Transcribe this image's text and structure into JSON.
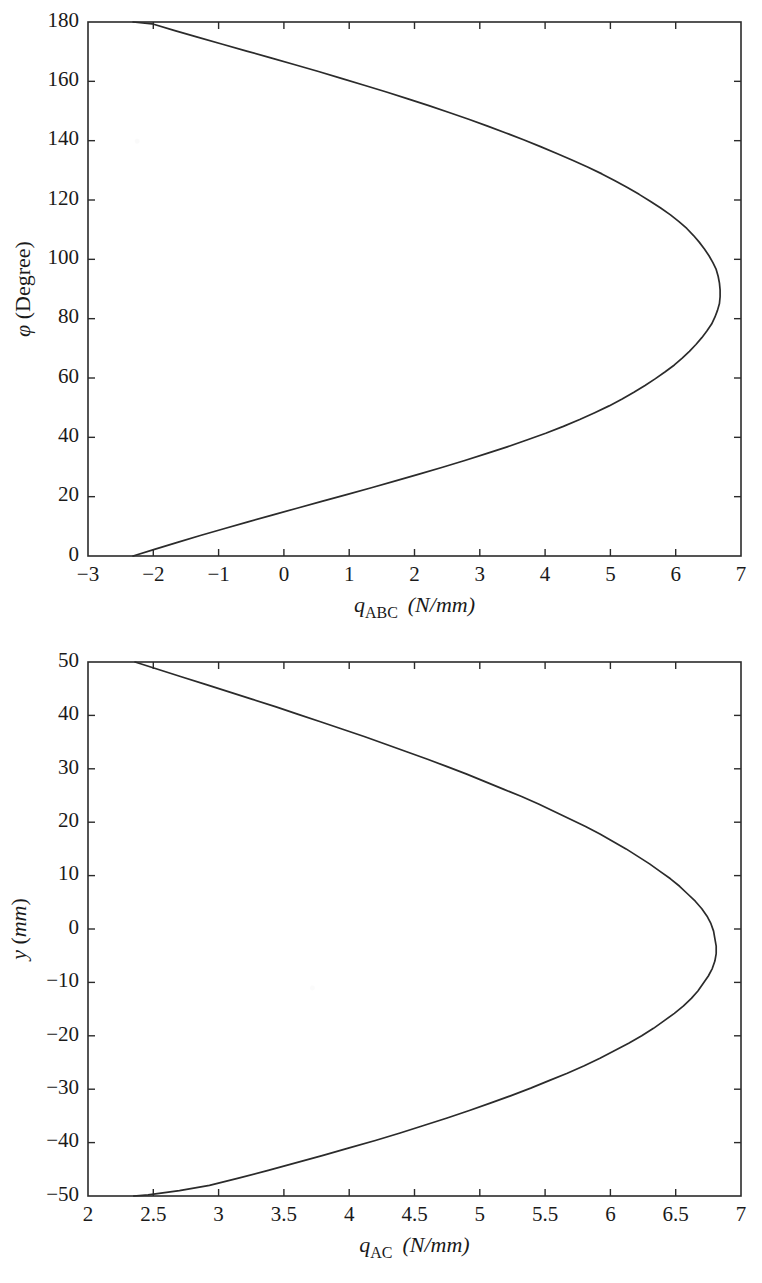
{
  "page": {
    "width": 762,
    "height": 1283,
    "background": "#ffffff",
    "ink_color": "#2b2b2b"
  },
  "chart_data": [
    {
      "id": "chart-qabc",
      "type": "line",
      "title": "",
      "subtitle": "",
      "xlabel_plain": "q_ABC (N/mm)",
      "xlabel_parts": {
        "symbol": "q",
        "subscript": "ABC",
        "unit": "(N/mm)"
      },
      "ylabel_plain": "φ (Degree)",
      "ylabel_parts": {
        "symbol": "φ",
        "unit": "(Degree)"
      },
      "xlim": [
        -3,
        7
      ],
      "ylim": [
        0,
        180
      ],
      "xticks": [
        -3,
        -2,
        -1,
        0,
        1,
        2,
        3,
        4,
        5,
        6,
        7
      ],
      "xticklabels": [
        "−3",
        "−2",
        "−1",
        "0",
        "1",
        "2",
        "3",
        "4",
        "5",
        "6",
        "7"
      ],
      "yticks": [
        0,
        20,
        40,
        60,
        80,
        100,
        120,
        140,
        160,
        180
      ],
      "yticklabels": [
        "0",
        "20",
        "40",
        "60",
        "80",
        "100",
        "120",
        "140",
        "160",
        "180"
      ],
      "grid": false,
      "legend": null,
      "series": [
        {
          "name": "q_ABC",
          "color": "#2b2b2b",
          "x": [
            -2.31,
            -1.97,
            -1.63,
            -1.28,
            -0.92,
            -0.55,
            -0.18,
            0.2,
            0.58,
            0.96,
            1.34,
            1.71,
            2.07,
            2.43,
            2.77,
            3.1,
            3.42,
            3.72,
            4.01,
            4.28,
            4.53,
            4.76,
            4.98,
            5.18,
            5.36,
            5.53,
            5.69,
            5.84,
            5.98,
            6.1,
            6.21,
            6.31,
            6.4,
            6.48,
            6.55,
            6.6,
            6.64,
            6.67,
            6.68,
            6.68,
            6.67,
            6.65,
            6.62,
            6.57,
            6.51,
            6.44,
            6.36,
            6.27,
            6.17,
            6.05,
            5.92,
            5.77,
            5.61,
            5.44,
            5.26,
            5.07,
            4.87,
            4.65,
            4.42,
            4.18,
            3.93,
            3.67,
            3.4,
            3.12,
            2.83,
            2.53,
            2.22,
            1.9,
            1.57,
            1.23,
            0.88,
            0.53,
            0.17,
            -0.2,
            -0.57,
            -0.94,
            -1.31,
            -1.67,
            -2.02,
            -2.31
          ],
          "y": [
            0,
            2.3,
            4.6,
            6.9,
            9.2,
            11.5,
            13.8,
            16.1,
            18.4,
            20.7,
            23.0,
            25.3,
            27.6,
            29.9,
            32.2,
            34.5,
            36.8,
            39.1,
            41.4,
            43.7,
            46.0,
            48.3,
            50.6,
            52.9,
            55.2,
            57.5,
            59.8,
            62.1,
            64.4,
            66.7,
            69.0,
            71.3,
            73.6,
            75.9,
            78.2,
            80.5,
            82.8,
            85.1,
            87.4,
            89.7,
            92.0,
            94.3,
            96.6,
            98.9,
            101.2,
            103.5,
            105.8,
            108.1,
            110.4,
            112.7,
            115.0,
            117.3,
            119.6,
            121.9,
            124.2,
            126.5,
            128.8,
            131.1,
            133.4,
            135.7,
            138.0,
            140.3,
            142.6,
            144.9,
            147.2,
            149.5,
            151.8,
            154.1,
            156.4,
            158.7,
            161.0,
            163.3,
            165.6,
            167.9,
            170.2,
            172.5,
            174.8,
            177.1,
            179.4,
            180
          ]
        }
      ],
      "annotations": {
        "curve_min_x": -2.31,
        "curve_max_x": 6.68,
        "curve_max_at_y": 88
      }
    },
    {
      "id": "chart-qac",
      "type": "line",
      "title": "",
      "subtitle": "",
      "xlabel_plain": "q_AC (N/mm)",
      "xlabel_parts": {
        "symbol": "q",
        "subscript": "AC",
        "unit": "(N/mm)"
      },
      "ylabel_plain": "y (mm)",
      "ylabel_parts": {
        "symbol": "y",
        "unit": "(mm)"
      },
      "xlim": [
        2,
        7
      ],
      "ylim": [
        -50,
        50
      ],
      "xticks": [
        2,
        2.5,
        3,
        3.5,
        4,
        4.5,
        5,
        5.5,
        6,
        6.5,
        7
      ],
      "xticklabels": [
        "2",
        "2.5",
        "3",
        "3.5",
        "4",
        "4.5",
        "5",
        "5.5",
        "6",
        "6.5",
        "7"
      ],
      "yticks": [
        -50,
        -40,
        -30,
        -20,
        -10,
        0,
        10,
        20,
        30,
        40,
        50
      ],
      "yticklabels": [
        "−50",
        "−40",
        "−30",
        "−20",
        "−10",
        "0",
        "10",
        "20",
        "30",
        "40",
        "50"
      ],
      "grid": false,
      "legend": null,
      "series": [
        {
          "name": "q_AC",
          "color": "#2b2b2b",
          "x": [
            2.36,
            2.54,
            2.72,
            2.9,
            3.08,
            3.26,
            3.44,
            3.61,
            3.78,
            3.95,
            4.12,
            4.28,
            4.44,
            4.6,
            4.75,
            4.9,
            5.04,
            5.18,
            5.32,
            5.45,
            5.57,
            5.69,
            5.81,
            5.92,
            6.02,
            6.12,
            6.21,
            6.3,
            6.38,
            6.46,
            6.53,
            6.59,
            6.65,
            6.7,
            6.74,
            6.77,
            6.79,
            6.8,
            6.81,
            6.81,
            6.8,
            6.78,
            6.75,
            6.71,
            6.67,
            6.62,
            6.56,
            6.49,
            6.41,
            6.33,
            6.24,
            6.14,
            6.03,
            5.92,
            5.8,
            5.67,
            5.53,
            5.39,
            5.24,
            5.08,
            4.92,
            4.75,
            4.57,
            4.39,
            4.2,
            4.0,
            3.8,
            3.59,
            3.38,
            3.16,
            2.93,
            2.7,
            2.46,
            2.35
          ],
          "y": [
            50,
            48.6,
            47.2,
            45.8,
            44.4,
            43.0,
            41.6,
            40.2,
            38.8,
            37.4,
            36.0,
            34.6,
            33.2,
            31.8,
            30.4,
            29.0,
            27.6,
            26.2,
            24.8,
            23.4,
            22.0,
            20.6,
            19.2,
            17.8,
            16.4,
            15.0,
            13.6,
            12.2,
            10.8,
            9.4,
            8.0,
            6.6,
            5.2,
            3.8,
            2.4,
            1.0,
            -0.4,
            -1.8,
            -3.2,
            -4.6,
            -6.0,
            -7.4,
            -8.8,
            -10.2,
            -11.6,
            -13.0,
            -14.4,
            -15.8,
            -17.2,
            -18.6,
            -20.0,
            -21.4,
            -22.8,
            -24.2,
            -25.6,
            -27.0,
            -28.4,
            -29.8,
            -31.2,
            -32.6,
            -34.0,
            -35.4,
            -36.8,
            -38.2,
            -39.6,
            -41.0,
            -42.4,
            -43.8,
            -45.2,
            -46.6,
            -48.0,
            -49.0,
            -49.8,
            -50
          ]
        }
      ],
      "annotations": {
        "curve_min_x": 2.35,
        "curve_max_x": 6.81,
        "curve_max_at_y": 0
      }
    }
  ],
  "layout": {
    "figure1": {
      "plot_left": 88,
      "plot_top": 22,
      "plot_right": 741,
      "plot_bottom": 556
    },
    "figure2": {
      "plot_left": 88,
      "plot_top": 22,
      "plot_right": 741,
      "plot_bottom": 556
    }
  }
}
